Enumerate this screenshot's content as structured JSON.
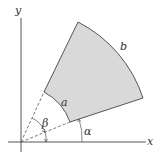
{
  "diagram": {
    "axes": {
      "x_label": "x",
      "y_label": "y"
    },
    "sector": {
      "inner_radius_label": "a",
      "outer_radius_label": "b",
      "fill": "#d9d9d9",
      "stroke": "#555555"
    },
    "angles": {
      "alpha_label": "α",
      "beta_label": "β"
    }
  }
}
